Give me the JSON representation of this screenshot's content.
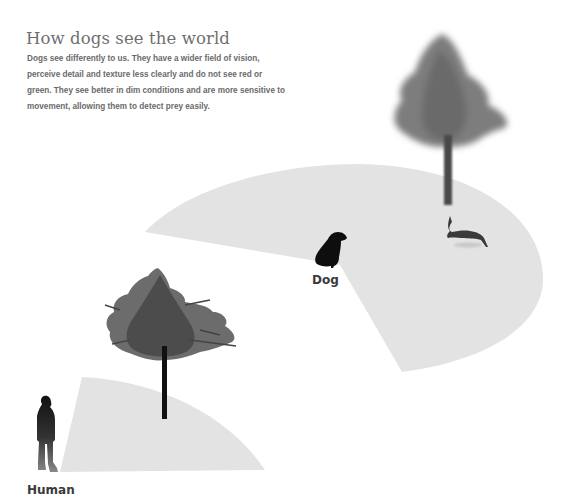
{
  "header": {
    "title": "How dogs see the world",
    "description": "Dogs see differently to us. They have a wider field of vision, perceive detail and texture less clearly and do not see red or green. They see better in dim conditions and are more sensitive to movement, allowing them to detect prey easily."
  },
  "labels": {
    "dog": "Dog",
    "human": "Human"
  },
  "figures": {
    "dog_field_of_view": "wide wedge",
    "human_field_of_view": "narrow wedge",
    "near_tree": "sharp, detailed tree",
    "far_tree": "blurred tree",
    "prey": "rabbit"
  },
  "colors": {
    "field_fill": "#e3e3e3",
    "title_text": "#6f6f6f",
    "body_text": "#6a6a6a",
    "silhouette": "#111111",
    "near_tree_foliage": "#555555",
    "far_tree_foliage": "#7a7a7a"
  }
}
